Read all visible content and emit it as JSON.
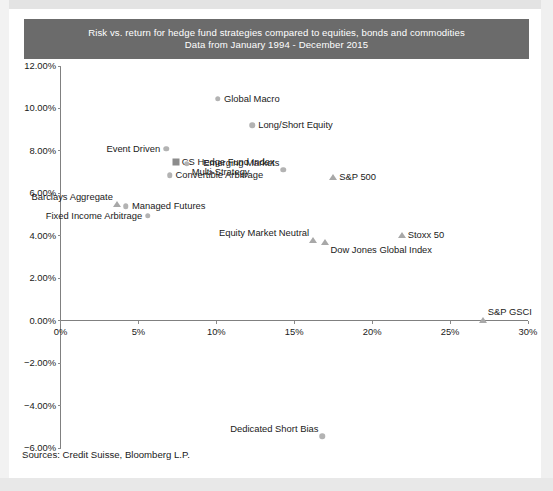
{
  "chart_data": {
    "type": "scatter",
    "title": "Risk vs. return for hedge fund strategies compared to equities, bonds and commodities",
    "subtitle": "Data from January 1994 - December 2015",
    "xlabel": "",
    "ylabel": "",
    "xlim": [
      0,
      30
    ],
    "ylim": [
      -6,
      12
    ],
    "xticks": [
      "0%",
      "5%",
      "10%",
      "15%",
      "20%",
      "25%",
      "30%"
    ],
    "xtick_values": [
      0,
      5,
      10,
      15,
      20,
      25,
      30
    ],
    "yticks": [
      "12.00%",
      "10.00%",
      "8.00%",
      "6.00%",
      "4.00%",
      "2.00%",
      "0.00%",
      "−2.00%",
      "−4.00%",
      "−6.00%"
    ],
    "ytick_values": [
      12,
      10,
      8,
      6,
      4,
      2,
      0,
      -2,
      -4,
      -6
    ],
    "grid": false,
    "legend": "none",
    "source_note": "Sources: Credit Suisse, Bloomberg L.P.",
    "points": [
      {
        "label": "Global Macro",
        "x": 10.1,
        "y": 10.45,
        "marker": "circle",
        "label_pos": "right"
      },
      {
        "label": "Long/Short Equity",
        "x": 12.3,
        "y": 9.2,
        "marker": "circle",
        "label_pos": "right"
      },
      {
        "label": "Event Driven",
        "x": 6.8,
        "y": 8.1,
        "marker": "circle",
        "label_pos": "left"
      },
      {
        "label": "CS Hedge Fund Index",
        "x": 7.4,
        "y": 7.5,
        "marker": "square",
        "label_pos": "right"
      },
      {
        "label": "Multi-Strategy",
        "x": 8.1,
        "y": 7.4,
        "marker": "circle",
        "label_pos": "below-right"
      },
      {
        "label": "Convertible Arbitrage",
        "x": 7.0,
        "y": 6.85,
        "marker": "circle",
        "label_pos": "right"
      },
      {
        "label": "Emerging Markets",
        "x": 14.3,
        "y": 7.1,
        "marker": "circle",
        "label_pos": "above-left"
      },
      {
        "label": "S&P 500",
        "x": 17.5,
        "y": 6.75,
        "marker": "triangle",
        "label_pos": "right"
      },
      {
        "label": "Barclays Aggregate",
        "x": 3.6,
        "y": 5.5,
        "marker": "triangle",
        "label_pos": "above-left"
      },
      {
        "label": "Managed Futures",
        "x": 4.2,
        "y": 5.4,
        "marker": "circle",
        "label_pos": "right"
      },
      {
        "label": "Fixed Income Arbitrage",
        "x": 5.6,
        "y": 4.95,
        "marker": "circle",
        "label_pos": "left"
      },
      {
        "label": "Equity Market Neutral",
        "x": 16.2,
        "y": 3.8,
        "marker": "triangle",
        "label_pos": "above-left"
      },
      {
        "label": "Dow Jones Global Index",
        "x": 17.0,
        "y": 3.7,
        "marker": "triangle",
        "label_pos": "below-right"
      },
      {
        "label": "Stoxx 50",
        "x": 21.9,
        "y": 4.05,
        "marker": "triangle",
        "label_pos": "right"
      },
      {
        "label": "S&P GSCI",
        "x": 27.1,
        "y": 0.05,
        "marker": "triangle",
        "label_pos": "above-right"
      },
      {
        "label": "Dedicated Short Bias",
        "x": 16.8,
        "y": -5.45,
        "marker": "circle",
        "label_pos": "above-left"
      }
    ],
    "colors": {
      "banner": "#6b6b6b",
      "banner_text": "#ffffff",
      "circle_marker": "#b3b3b3",
      "square_marker": "#8c8c8c",
      "triangle_marker": "#a8a8a8",
      "axis": "#808080",
      "text": "#1a1a1a"
    }
  }
}
